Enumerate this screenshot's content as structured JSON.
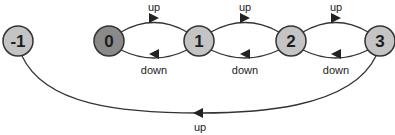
{
  "diagram": {
    "type": "state-transition",
    "colors": {
      "node_fill": "#c4c4c4",
      "start_node_fill": "#8a8a8a",
      "stroke": "#333333",
      "background": "#ffffff"
    },
    "nodes": [
      {
        "id": "-1",
        "label": "-1",
        "cx": 18,
        "cy": 41,
        "start": false
      },
      {
        "id": "0",
        "label": "0",
        "cx": 109,
        "cy": 41,
        "start": true
      },
      {
        "id": "1",
        "label": "1",
        "cx": 199,
        "cy": 41,
        "start": false
      },
      {
        "id": "2",
        "label": "2",
        "cx": 291,
        "cy": 41,
        "start": false
      },
      {
        "id": "3",
        "label": "3",
        "cx": 380,
        "cy": 41,
        "start": false
      }
    ],
    "edges": [
      {
        "from": "0",
        "to": "1",
        "label": "up"
      },
      {
        "from": "1",
        "to": "0",
        "label": "down"
      },
      {
        "from": "1",
        "to": "2",
        "label": "up"
      },
      {
        "from": "2",
        "to": "1",
        "label": "down"
      },
      {
        "from": "2",
        "to": "3",
        "label": "up"
      },
      {
        "from": "3",
        "to": "2",
        "label": "down"
      },
      {
        "from": "3",
        "to": "-1",
        "label": "up"
      }
    ]
  }
}
